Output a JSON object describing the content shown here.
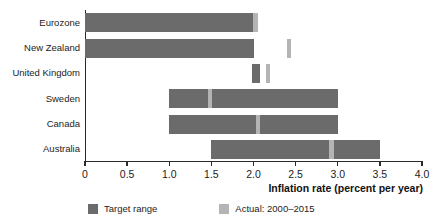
{
  "chart_data": {
    "type": "bar",
    "title": "",
    "subtitle": "",
    "orientation": "horizontal",
    "xlabel": "Inflation rate (percent per year)",
    "ylabel": "",
    "xlim": [
      0,
      4.0
    ],
    "xticks": [
      0,
      0.5,
      1.0,
      1.5,
      2.0,
      2.5,
      3.0,
      3.5,
      4.0
    ],
    "xtick_labels": [
      "0",
      "0.5",
      "1.0",
      "1.5",
      "2.0",
      "2.5",
      "3.0",
      "3.5",
      "4.0"
    ],
    "grid": false,
    "legend_position": "bottom",
    "categories": [
      "Eurozone",
      "New Zealand",
      "United Kingdom",
      "Sweden",
      "Canada",
      "Australia"
    ],
    "series": [
      {
        "name": "Target range",
        "color": "#6b6b6b",
        "type": "range",
        "values": [
          {
            "category": "Eurozone",
            "low": 0.0,
            "high": 2.0
          },
          {
            "category": "New Zealand",
            "low": 0.0,
            "high": 2.0
          },
          {
            "category": "United Kingdom",
            "low": 1.98,
            "high": 2.08
          },
          {
            "category": "Sweden",
            "low": 1.0,
            "high": 3.0
          },
          {
            "category": "Canada",
            "low": 1.0,
            "high": 3.0
          },
          {
            "category": "Australia",
            "low": 1.5,
            "high": 3.5
          }
        ]
      },
      {
        "name": "Actual: 2000–2015",
        "color": "#b4b4b4",
        "type": "marker",
        "values": [
          {
            "category": "Eurozone",
            "value": 2.02
          },
          {
            "category": "New Zealand",
            "value": 2.42
          },
          {
            "category": "United Kingdom",
            "value": 2.17
          },
          {
            "category": "Sweden",
            "value": 1.48
          },
          {
            "category": "Canada",
            "value": 2.05
          },
          {
            "category": "Australia",
            "value": 2.92
          }
        ]
      }
    ],
    "legend_entries": [
      "Target range",
      "Actual: 2000–2015"
    ]
  },
  "axis": {
    "x_title": "Inflation rate (percent per year)",
    "tick_labels": [
      "0",
      "0.5",
      "1.0",
      "1.5",
      "2.0",
      "2.5",
      "3.0",
      "3.5",
      "4.0"
    ]
  },
  "categories": {
    "eurozone": "Eurozone",
    "new_zealand": "New Zealand",
    "united_kingdom": "United Kingdom",
    "sweden": "Sweden",
    "canada": "Canada",
    "australia": "Australia"
  },
  "legend": {
    "target_label": "Target range",
    "actual_label": "Actual: 2000–2015"
  },
  "colors": {
    "target": "#6b6b6b",
    "actual": "#b4b4b4",
    "axis": "#2b2b2b",
    "text": "#1c1c1c",
    "background": "#ffffff"
  }
}
